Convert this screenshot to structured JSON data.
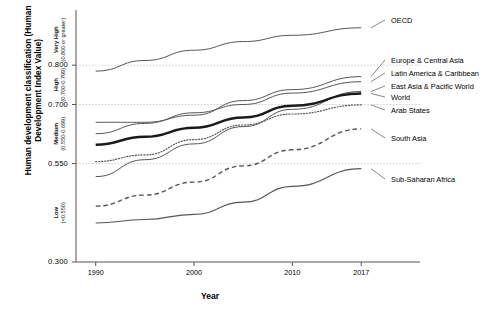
{
  "chart_data": {
    "type": "line",
    "title": "",
    "xlabel": "Year",
    "ylabel": "Human development classification (Human Development Index Value)",
    "x": [
      1990,
      1995,
      2000,
      2005,
      2010,
      2017
    ],
    "xlim": [
      1988,
      2018
    ],
    "ylim": [
      0.3,
      0.93
    ],
    "xticks": [
      "1990",
      "2000",
      "2010",
      "2017"
    ],
    "yticks": [
      "0.800",
      "0.700",
      "0.550",
      "0.300"
    ],
    "ytick_values": [
      0.8,
      0.7,
      0.55,
      0.3
    ],
    "grid": "horizontal-dotted",
    "legend_position": "right-inline-labels",
    "classification_bands": [
      {
        "name": "Very High",
        "range": "(0.800 or greater)",
        "min": 0.8,
        "max": 0.93
      },
      {
        "name": "High",
        "range": "(0.700-0.799)",
        "min": 0.7,
        "max": 0.8
      },
      {
        "name": "Medium",
        "range": "(0.550-0.699)",
        "min": 0.55,
        "max": 0.7
      },
      {
        "name": "Low",
        "range": "(<0.550)",
        "min": 0.3,
        "max": 0.55
      }
    ],
    "series": [
      {
        "name": "OECD",
        "style": "solid",
        "width": 1.0,
        "values": [
          0.785,
          0.812,
          0.838,
          0.86,
          0.876,
          0.895
        ]
      },
      {
        "name": "Europe & Central Asia",
        "style": "solid",
        "width": 1.0,
        "values": [
          0.655,
          0.655,
          0.673,
          0.71,
          0.738,
          0.771
        ]
      },
      {
        "name": "Latin America & Caribbean",
        "style": "solid",
        "width": 1.0,
        "values": [
          0.626,
          0.652,
          0.679,
          0.7,
          0.729,
          0.758
        ]
      },
      {
        "name": "East Asia & Pacific World",
        "style": "solid",
        "width": 1.0,
        "values": [
          0.517,
          0.56,
          0.6,
          0.644,
          0.688,
          0.733
        ]
      },
      {
        "name": "World",
        "style": "solid",
        "width": 2.4,
        "values": [
          0.598,
          0.618,
          0.641,
          0.667,
          0.697,
          0.728
        ]
      },
      {
        "name": "Arab States",
        "style": "dotted",
        "width": 1.2,
        "values": [
          0.555,
          0.572,
          0.611,
          0.648,
          0.676,
          0.699
        ]
      },
      {
        "name": "South Asia",
        "style": "dashed",
        "width": 1.4,
        "values": [
          0.442,
          0.47,
          0.503,
          0.544,
          0.585,
          0.638
        ]
      },
      {
        "name": "Sub-Saharan Africa",
        "style": "solid",
        "width": 1.2,
        "values": [
          0.399,
          0.408,
          0.421,
          0.452,
          0.492,
          0.537
        ]
      }
    ],
    "colors": {
      "line": "#1a1a1a",
      "thin_line": "#555555",
      "grid": "#bdbdbd",
      "axis": "#555555",
      "background": "#ffffff"
    }
  }
}
